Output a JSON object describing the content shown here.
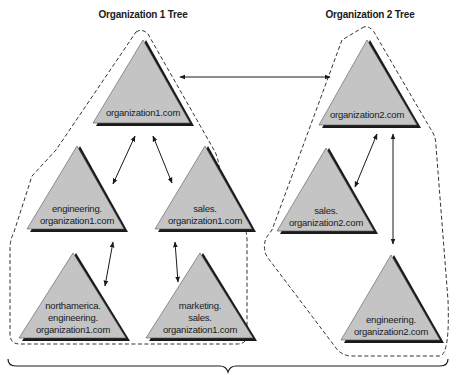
{
  "titles": {
    "org1": "Organization 1 Tree",
    "org2": "Organization 2 Tree"
  },
  "colors": {
    "triangle_fill": "#c4c4c4",
    "triangle_shadow": "#1a1a1a",
    "dashed_boundary": "#333333",
    "arrow": "#1a1a1a"
  },
  "trees": [
    {
      "name": "Organization 1 Tree",
      "domains": [
        {
          "id": "org1-root",
          "lines": [
            "organization1.com"
          ]
        },
        {
          "id": "org1-eng",
          "lines": [
            "engineering.",
            "organization1.com"
          ]
        },
        {
          "id": "org1-sales",
          "lines": [
            "sales.",
            "organization1.com"
          ]
        },
        {
          "id": "org1-na-eng",
          "lines": [
            "northamerica.",
            "engineering.",
            "organization1.com"
          ]
        },
        {
          "id": "org1-mkt-sales",
          "lines": [
            "marketing.",
            "sales.",
            "organization1.com"
          ]
        }
      ]
    },
    {
      "name": "Organization 2 Tree",
      "domains": [
        {
          "id": "org2-root",
          "lines": [
            "organization2.com"
          ]
        },
        {
          "id": "org2-sales",
          "lines": [
            "sales.",
            "organization2.com"
          ]
        },
        {
          "id": "org2-eng",
          "lines": [
            "engineering.",
            "organization2.com"
          ]
        }
      ]
    }
  ],
  "trust_links": [
    [
      "organization1.com",
      "organization2.com"
    ],
    [
      "organization1.com",
      "engineering.organization1.com"
    ],
    [
      "organization1.com",
      "sales.organization1.com"
    ],
    [
      "engineering.organization1.com",
      "northamerica.engineering.organization1.com"
    ],
    [
      "sales.organization1.com",
      "marketing.sales.organization1.com"
    ],
    [
      "organization2.com",
      "sales.organization2.com"
    ],
    [
      "organization2.com",
      "engineering.organization2.com"
    ]
  ],
  "nodes": {
    "n1": {
      "l0": "organization1.com"
    },
    "n2": {
      "l0": "engineering.",
      "l1": "organization1.com"
    },
    "n3": {
      "l0": "sales.",
      "l1": "organization1.com"
    },
    "n4": {
      "l0": "northamerica.",
      "l1": "engineering.",
      "l2": "organization1.com"
    },
    "n5": {
      "l0": "marketing.",
      "l1": "sales.",
      "l2": "organization1.com"
    },
    "n6": {
      "l0": "organization2.com"
    },
    "n7": {
      "l0": "sales.",
      "l1": "organization2.com"
    },
    "n8": {
      "l0": "engineering.",
      "l1": "organization2.com"
    }
  }
}
